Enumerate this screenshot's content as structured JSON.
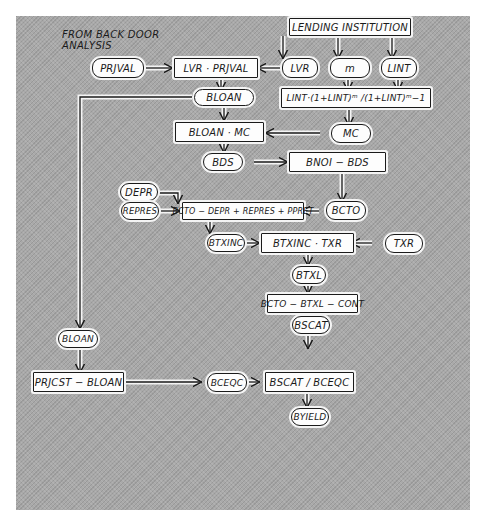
{
  "annotation": {
    "line1": "FROM BACK DOOR",
    "line2": "ANALYSIS"
  },
  "colors": {
    "background": "#a9a9a9",
    "node_fill": "#fdfdfd",
    "ink": "#1a1a1a"
  },
  "nodes": {
    "lending_institution": "LENDING INSTITUTION",
    "prjval": "PRJVAL",
    "lvr_prjval": "LVR · PRJVAL",
    "lvr": "LVR",
    "m": "m",
    "lint": "LINT",
    "bloan": "BLOAN",
    "mc_formula": "LINT·(1+LINT)ᵐ /(1+LINT)ᵐ−1",
    "bloan_mc": "BLOAN · MC",
    "mc": "MC",
    "bds": "BDS",
    "bnoi_bds": "BNOI  − BDS",
    "depr": "DEPR",
    "repres": "REPRES",
    "bcto_formula": "BCTO − DEPR + REPRES + PPRET",
    "bcto": "BCTO",
    "btxinc": "BTXINC",
    "btxinc_txr": "BTXINC  · TXR",
    "txr": "TXR",
    "btxl": "BTXL",
    "bcto_btxl_cont": "BCTO − BTXL − CONT",
    "bscat": "BSCAT",
    "bloan_left": "BLOAN",
    "prjcst_bloan": "PRJCST − BLOAN",
    "bceqc": "BCEQC",
    "bscat_bceqc": "BSCAT / BCEQC",
    "byield": "BYIELD"
  },
  "edges": [
    [
      "lending_institution",
      "lvr"
    ],
    [
      "lending_institution",
      "m"
    ],
    [
      "lending_institution",
      "lint"
    ],
    [
      "prjval",
      "lvr_prjval"
    ],
    [
      "lvr",
      "lvr_prjval"
    ],
    [
      "m",
      "mc_formula"
    ],
    [
      "lint",
      "mc_formula"
    ],
    [
      "lvr_prjval",
      "bloan"
    ],
    [
      "bloan",
      "bloan_mc"
    ],
    [
      "mc_formula",
      "mc"
    ],
    [
      "mc",
      "bloan_mc"
    ],
    [
      "bloan_mc",
      "bds"
    ],
    [
      "bds",
      "bnoi_bds"
    ],
    [
      "bnoi_bds",
      "bcto"
    ],
    [
      "depr",
      "bcto_formula"
    ],
    [
      "repres",
      "bcto_formula"
    ],
    [
      "bcto",
      "bcto_formula"
    ],
    [
      "bcto_formula",
      "btxinc"
    ],
    [
      "btxinc",
      "btxinc_txr"
    ],
    [
      "txr",
      "btxinc_txr"
    ],
    [
      "btxinc_txr",
      "btxl"
    ],
    [
      "btxl",
      "bcto_btxl_cont"
    ],
    [
      "bcto_btxl_cont",
      "bscat"
    ],
    [
      "bscat",
      "bscat_bceqc"
    ],
    [
      "bloan",
      "bloan_left"
    ],
    [
      "bloan_left",
      "prjcst_bloan"
    ],
    [
      "prjcst_bloan",
      "bceqc"
    ],
    [
      "bceqc",
      "bscat_bceqc"
    ],
    [
      "bscat_bceqc",
      "byield"
    ]
  ]
}
